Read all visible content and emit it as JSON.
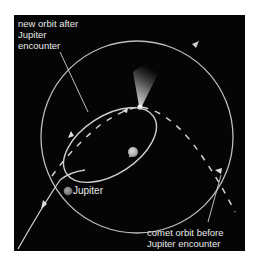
{
  "diagram": {
    "type": "orbit-diagram",
    "colors": {
      "background": "#050505",
      "orbit_line": "#c8c8c8",
      "text": "#e8e8e8",
      "sun": "#c0c0c0",
      "jupiter": "#8a8a8a"
    },
    "labels": {
      "new_orbit": [
        "new orbit after",
        "Jupiter",
        "encounter"
      ],
      "jupiter": "Jupiter",
      "comet_orbit": [
        "comet orbit before",
        "Jupiter encounter"
      ]
    },
    "elements": [
      {
        "id": "jupiter-orbit",
        "shape": "circle",
        "description": "Jupiter's orbit around the Sun"
      },
      {
        "id": "new-comet-orbit",
        "shape": "ellipse",
        "description": "comet's new elliptical orbit after Jupiter encounter"
      },
      {
        "id": "old-comet-orbit",
        "shape": "parabola-dashed",
        "description": "comet orbit before Jupiter encounter"
      },
      {
        "id": "sun",
        "shape": "dot"
      },
      {
        "id": "jupiter",
        "shape": "dot"
      },
      {
        "id": "comet-tail",
        "shape": "glow"
      }
    ]
  }
}
